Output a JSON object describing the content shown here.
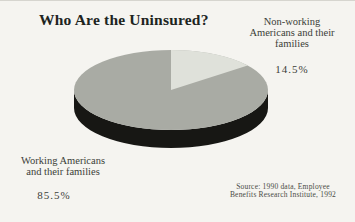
{
  "figure": {
    "title": "Who Are the Uninsured?"
  },
  "chart_data": {
    "type": "pie",
    "style": "3d",
    "title": "Who Are the Uninsured?",
    "unit": "%",
    "slices": [
      {
        "label": "Working Americans and their families",
        "value": 85.5,
        "display": "85.5%",
        "color": "#a9aba4"
      },
      {
        "label": "Non-working Americans and their families",
        "value": 14.5,
        "display": "14.5%",
        "color": "#dfe1da"
      }
    ],
    "wedge_start_deg": 90,
    "wedge_direction": "clockwise",
    "side_color": "#171714",
    "legend_position": "callout-labels",
    "source": "Source: 1990 data, Employee Benefits Research Institute, 1992"
  },
  "callouts": {
    "nonworking": {
      "line1": "Non-working",
      "line2": "Americans and their",
      "line3": "families",
      "value": "14.5%"
    },
    "working": {
      "line1": "Working Americans",
      "line2": "and their families",
      "value": "85.5%"
    }
  },
  "source": {
    "line1": "Source: 1990 data, Employee",
    "line2": "Benefits Research Institute, 1992"
  },
  "colors": {
    "background": "#f5f4f0",
    "title_text": "#20241e",
    "label_text": "#3b3e38",
    "source_text": "#4a4c45",
    "main_slice": "#a9aba4",
    "light_slice": "#dfe1da",
    "pie_side": "#171714"
  }
}
